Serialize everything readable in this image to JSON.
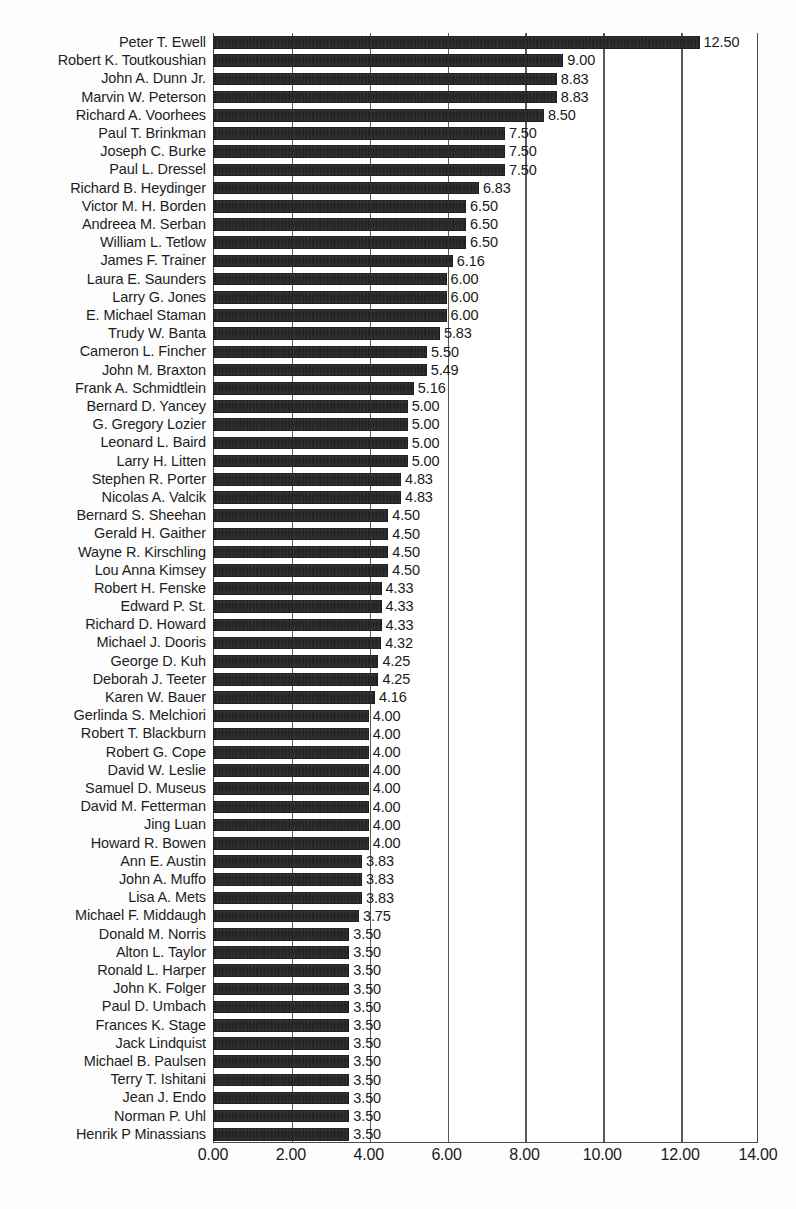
{
  "chart_data": {
    "type": "bar",
    "orientation": "horizontal",
    "title": "",
    "subtitle": "",
    "xlabel": "",
    "ylabel": "",
    "xlim": [
      0,
      14
    ],
    "ylim": null,
    "grid": true,
    "legend": null,
    "value_label_format": "0.00",
    "xticks": [
      "0.00",
      "2.00",
      "4.00",
      "6.00",
      "8.00",
      "10.00",
      "12.00",
      "14.00"
    ],
    "xtick_values": [
      0,
      2,
      4,
      6,
      8,
      10,
      12,
      14
    ],
    "bar_color": "#262626",
    "categories": [
      "Peter T. Ewell",
      "Robert K. Toutkoushian",
      "John A. Dunn Jr.",
      "Marvin W. Peterson",
      "Richard A. Voorhees",
      "Paul T. Brinkman",
      "Joseph C. Burke",
      "Paul L. Dressel",
      "Richard B. Heydinger",
      "Victor M. H. Borden",
      "Andreea M. Serban",
      "William L. Tetlow",
      "James F. Trainer",
      "Laura E. Saunders",
      "Larry G. Jones",
      "E. Michael Staman",
      "Trudy W. Banta",
      "Cameron L. Fincher",
      "John M. Braxton",
      "Frank A. Schmidtlein",
      "Bernard D. Yancey",
      "G. Gregory Lozier",
      "Leonard L. Baird",
      "Larry H. Litten",
      "Stephen R. Porter",
      "Nicolas A. Valcik",
      "Bernard S. Sheehan",
      "Gerald H. Gaither",
      "Wayne R. Kirschling",
      "Lou Anna Kimsey",
      "Robert H. Fenske",
      "Edward P. St.",
      "Richard D. Howard",
      "Michael J. Dooris",
      "George D. Kuh",
      "Deborah J. Teeter",
      "Karen W. Bauer",
      "Gerlinda S. Melchiori",
      "Robert T. Blackburn",
      "Robert G. Cope",
      "David W. Leslie",
      "Samuel D. Museus",
      "David M. Fetterman",
      "Jing Luan",
      "Howard R. Bowen",
      "Ann E. Austin",
      "John A. Muffo",
      "Lisa A. Mets",
      "Michael F. Middaugh",
      "Donald M. Norris",
      "Alton L. Taylor",
      "Ronald L. Harper",
      "John K. Folger",
      "Paul D. Umbach",
      "Frances K. Stage",
      "Jack Lindquist",
      "Michael B. Paulsen",
      "Terry T. Ishitani",
      "Jean J. Endo",
      "Norman P. Uhl",
      "Henrik P Minassians"
    ],
    "values": [
      12.5,
      9.0,
      8.83,
      8.83,
      8.5,
      7.5,
      7.5,
      7.5,
      6.83,
      6.5,
      6.5,
      6.5,
      6.16,
      6.0,
      6.0,
      6.0,
      5.83,
      5.5,
      5.49,
      5.16,
      5.0,
      5.0,
      5.0,
      5.0,
      4.83,
      4.83,
      4.5,
      4.5,
      4.5,
      4.5,
      4.33,
      4.33,
      4.33,
      4.32,
      4.25,
      4.25,
      4.16,
      4.0,
      4.0,
      4.0,
      4.0,
      4.0,
      4.0,
      4.0,
      4.0,
      3.83,
      3.83,
      3.83,
      3.75,
      3.5,
      3.5,
      3.5,
      3.5,
      3.5,
      3.5,
      3.5,
      3.5,
      3.5,
      3.5,
      3.5,
      3.5
    ],
    "value_labels": [
      "12.50",
      "9.00",
      "8.83",
      "8.83",
      "8.50",
      "7.50",
      "7.50",
      "7.50",
      "6.83",
      "6.50",
      "6.50",
      "6.50",
      "6.16",
      "6.00",
      "6.00",
      "6.00",
      "5.83",
      "5.50",
      "5.49",
      "5.16",
      "5.00",
      "5.00",
      "5.00",
      "5.00",
      "4.83",
      "4.83",
      "4.50",
      "4.50",
      "4.50",
      "4.50",
      "4.33",
      "4.33",
      "4.33",
      "4.32",
      "4.25",
      "4.25",
      "4.16",
      "4.00",
      "4.00",
      "4.00",
      "4.00",
      "4.00",
      "4.00",
      "4.00",
      "4.00",
      "3.83",
      "3.83",
      "3.83",
      "3.75",
      "3.50",
      "3.50",
      "3.50",
      "3.50",
      "3.50",
      "3.50",
      "3.50",
      "3.50",
      "3.50",
      "3.50",
      "3.50",
      "3.50"
    ]
  }
}
